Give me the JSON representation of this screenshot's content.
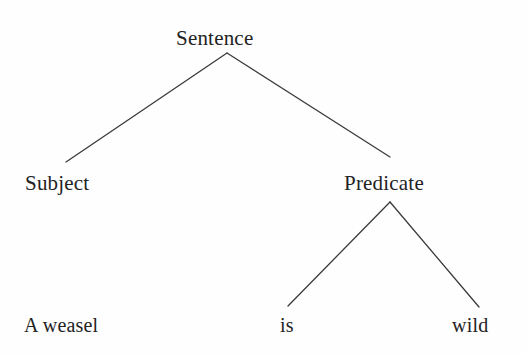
{
  "diagram": {
    "type": "syntax-tree",
    "background_color": "#fefefe",
    "line_color": "#3a3a3a",
    "text_color": "#232323",
    "nodes": {
      "root": {
        "label": "Sentence",
        "x": 227,
        "y": 53
      },
      "subject": {
        "label": "Subject",
        "x": 66,
        "y": 162
      },
      "predicate": {
        "label": "Predicate",
        "x": 390,
        "y": 202
      },
      "weasel": {
        "label": "A weasel",
        "x": 70,
        "y": 316
      },
      "is": {
        "label": "is",
        "x": 288,
        "y": 306
      },
      "wild": {
        "label": "wild",
        "x": 479,
        "y": 307
      }
    },
    "edges": [
      {
        "name": "sentence-to-subject",
        "from": "root",
        "to": "subject",
        "x1": 227,
        "y1": 53,
        "x2": 66,
        "y2": 162
      },
      {
        "name": "sentence-to-predicate",
        "from": "root",
        "to": "predicate",
        "x1": 227,
        "y1": 53,
        "x2": 390,
        "y2": 157
      },
      {
        "name": "predicate-to-is",
        "from": "predicate",
        "to": "is",
        "x1": 390,
        "y1": 202,
        "x2": 288,
        "y2": 306
      },
      {
        "name": "predicate-to-wild",
        "from": "predicate",
        "to": "wild",
        "x1": 390,
        "y1": 202,
        "x2": 479,
        "y2": 307
      }
    ]
  }
}
